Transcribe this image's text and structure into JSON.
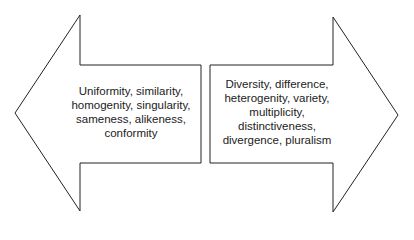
{
  "diagram": {
    "left_arrow": {
      "direction": "left",
      "lines": [
        "Uniformity, similarity,",
        "homogenity, singularity,",
        "sameness, alikeness,",
        "conformity"
      ]
    },
    "right_arrow": {
      "direction": "right",
      "lines": [
        "Diversity, difference,",
        "heterogenity, variety,",
        "multiplicity,",
        "distinctiveness,",
        "divergence, pluralism"
      ]
    },
    "colors": {
      "stroke": "#222222",
      "fill": "#ffffff",
      "text": "#222222"
    }
  }
}
